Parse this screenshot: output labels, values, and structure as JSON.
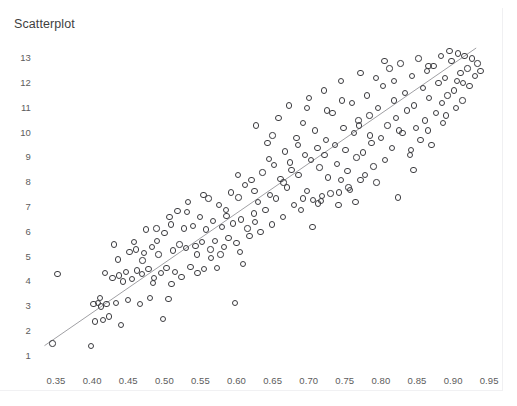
{
  "top_clipped_text": "·                    ·            ·                    ·",
  "chart_title": "Scatterplot",
  "axes": {
    "y_ticks": [
      "1",
      "2",
      "3",
      "4",
      "5",
      "6",
      "7",
      "8",
      "9",
      "10",
      "11",
      "12",
      "13"
    ],
    "x_ticks": [
      "0.35",
      "0.40",
      "0.45",
      "0.50",
      "0.55",
      "0.60",
      "0.65",
      "0.70",
      "0.75",
      "0.80",
      "0.85",
      "0.90",
      "0.95"
    ]
  },
  "colors": {
    "marker_stroke": "#3b3b3f",
    "trendline": "#a0a0a4",
    "tick_label": "#5c5c5c",
    "title": "#3f3f3f",
    "background": "#ffffff",
    "frame": "#f0f0f2"
  },
  "chart_data": {
    "type": "scatter",
    "title": "Scatterplot",
    "xlabel": "",
    "ylabel": "",
    "xlim": [
      0.325,
      0.965
    ],
    "ylim": [
      0.55,
      13.45
    ],
    "grid": false,
    "legend": "none",
    "x_tick_values": [
      0.35,
      0.4,
      0.45,
      0.5,
      0.55,
      0.6,
      0.65,
      0.7,
      0.75,
      0.8,
      0.85,
      0.9,
      0.95
    ],
    "y_tick_values": [
      1,
      2,
      3,
      4,
      5,
      6,
      7,
      8,
      9,
      10,
      11,
      12,
      13
    ],
    "marker": "open-circle",
    "series": [
      {
        "name": "observations",
        "points": [
          [
            0.345,
            1.45
          ],
          [
            0.352,
            4.25
          ],
          [
            0.398,
            1.35
          ],
          [
            0.402,
            3.05
          ],
          [
            0.404,
            2.35
          ],
          [
            0.408,
            3.1
          ],
          [
            0.411,
            3.3
          ],
          [
            0.415,
            2.4
          ],
          [
            0.418,
            4.3
          ],
          [
            0.42,
            3.05
          ],
          [
            0.423,
            2.55
          ],
          [
            0.428,
            4.1
          ],
          [
            0.43,
            5.45
          ],
          [
            0.433,
            3.1
          ],
          [
            0.437,
            4.2
          ],
          [
            0.44,
            2.2
          ],
          [
            0.443,
            3.95
          ],
          [
            0.447,
            4.35
          ],
          [
            0.45,
            3.2
          ],
          [
            0.452,
            5.15
          ],
          [
            0.455,
            4.05
          ],
          [
            0.458,
            5.55
          ],
          [
            0.462,
            4.4
          ],
          [
            0.466,
            3.05
          ],
          [
            0.469,
            4.25
          ],
          [
            0.472,
            5.1
          ],
          [
            0.475,
            6.05
          ],
          [
            0.478,
            4.45
          ],
          [
            0.48,
            3.3
          ],
          [
            0.483,
            5.35
          ],
          [
            0.486,
            4.1
          ],
          [
            0.489,
            6.1
          ],
          [
            0.492,
            5.05
          ],
          [
            0.495,
            4.3
          ],
          [
            0.498,
            2.45
          ],
          [
            0.5,
            5.9
          ],
          [
            0.503,
            4.5
          ],
          [
            0.506,
            3.25
          ],
          [
            0.509,
            6.25
          ],
          [
            0.512,
            5.2
          ],
          [
            0.515,
            4.35
          ],
          [
            0.518,
            6.8
          ],
          [
            0.521,
            5.45
          ],
          [
            0.524,
            4.15
          ],
          [
            0.527,
            6.1
          ],
          [
            0.53,
            5.3
          ],
          [
            0.533,
            7.15
          ],
          [
            0.536,
            4.55
          ],
          [
            0.54,
            6.2
          ],
          [
            0.543,
            5.4
          ],
          [
            0.546,
            4.3
          ],
          [
            0.549,
            6.55
          ],
          [
            0.552,
            5.55
          ],
          [
            0.555,
            4.45
          ],
          [
            0.558,
            6.05
          ],
          [
            0.561,
            7.3
          ],
          [
            0.564,
            5.25
          ],
          [
            0.567,
            6.4
          ],
          [
            0.57,
            5.6
          ],
          [
            0.573,
            4.5
          ],
          [
            0.576,
            7.05
          ],
          [
            0.58,
            6.15
          ],
          [
            0.583,
            5.35
          ],
          [
            0.586,
            6.6
          ],
          [
            0.589,
            5.7
          ],
          [
            0.592,
            7.55
          ],
          [
            0.595,
            6.3
          ],
          [
            0.598,
            3.1
          ],
          [
            0.6,
            5.5
          ],
          [
            0.603,
            7.35
          ],
          [
            0.606,
            6.45
          ],
          [
            0.609,
            4.65
          ],
          [
            0.612,
            7.85
          ],
          [
            0.615,
            6.1
          ],
          [
            0.618,
            5.8
          ],
          [
            0.621,
            8.05
          ],
          [
            0.624,
            6.7
          ],
          [
            0.627,
            10.25
          ],
          [
            0.63,
            7.15
          ],
          [
            0.633,
            5.95
          ],
          [
            0.636,
            8.35
          ],
          [
            0.64,
            6.85
          ],
          [
            0.643,
            9.55
          ],
          [
            0.646,
            7.45
          ],
          [
            0.649,
            6.25
          ],
          [
            0.652,
            8.65
          ],
          [
            0.655,
            7.3
          ],
          [
            0.658,
            10.55
          ],
          [
            0.661,
            8.1
          ],
          [
            0.664,
            6.55
          ],
          [
            0.667,
            9.2
          ],
          [
            0.67,
            7.75
          ],
          [
            0.673,
            11.05
          ],
          [
            0.676,
            8.45
          ],
          [
            0.68,
            7.05
          ],
          [
            0.683,
            9.75
          ],
          [
            0.686,
            8.25
          ],
          [
            0.689,
            6.85
          ],
          [
            0.692,
            10.35
          ],
          [
            0.695,
            9.05
          ],
          [
            0.698,
            7.6
          ],
          [
            0.7,
            11.35
          ],
          [
            0.703,
            8.85
          ],
          [
            0.706,
            7.25
          ],
          [
            0.709,
            10.05
          ],
          [
            0.712,
            9.35
          ],
          [
            0.715,
            8.55
          ],
          [
            0.718,
            7.4
          ],
          [
            0.721,
            11.65
          ],
          [
            0.724,
            9.65
          ],
          [
            0.727,
            8.15
          ],
          [
            0.73,
            7.5
          ],
          [
            0.733,
            10.75
          ],
          [
            0.736,
            9.45
          ],
          [
            0.739,
            8.7
          ],
          [
            0.742,
            7.55
          ],
          [
            0.745,
            12.05
          ],
          [
            0.748,
            10.15
          ],
          [
            0.751,
            9.25
          ],
          [
            0.754,
            8.4
          ],
          [
            0.757,
            7.65
          ],
          [
            0.76,
            11.15
          ],
          [
            0.763,
            9.95
          ],
          [
            0.766,
            8.95
          ],
          [
            0.769,
            10.45
          ],
          [
            0.772,
            12.35
          ],
          [
            0.775,
            9.15
          ],
          [
            0.778,
            8.25
          ],
          [
            0.781,
            11.45
          ],
          [
            0.784,
            10.65
          ],
          [
            0.787,
            9.55
          ],
          [
            0.79,
            8.6
          ],
          [
            0.793,
            12.15
          ],
          [
            0.796,
            10.95
          ],
          [
            0.8,
            9.75
          ],
          [
            0.803,
            11.85
          ],
          [
            0.806,
            8.85
          ],
          [
            0.809,
            10.25
          ],
          [
            0.812,
            12.55
          ],
          [
            0.815,
            9.35
          ],
          [
            0.818,
            11.25
          ],
          [
            0.821,
            10.55
          ],
          [
            0.824,
            7.35
          ],
          [
            0.827,
            12.75
          ],
          [
            0.83,
            9.95
          ],
          [
            0.833,
            11.55
          ],
          [
            0.836,
            10.85
          ],
          [
            0.84,
            9.05
          ],
          [
            0.843,
            12.25
          ],
          [
            0.846,
            11.05
          ],
          [
            0.849,
            10.15
          ],
          [
            0.852,
            12.95
          ],
          [
            0.855,
            9.65
          ],
          [
            0.858,
            11.75
          ],
          [
            0.861,
            10.45
          ],
          [
            0.864,
            12.45
          ],
          [
            0.867,
            11.35
          ],
          [
            0.87,
            9.45
          ],
          [
            0.873,
            12.65
          ],
          [
            0.876,
            10.75
          ],
          [
            0.88,
            11.95
          ],
          [
            0.883,
            13.05
          ],
          [
            0.886,
            10.35
          ],
          [
            0.889,
            12.15
          ],
          [
            0.892,
            11.45
          ],
          [
            0.895,
            13.25
          ],
          [
            0.898,
            12.85
          ],
          [
            0.901,
            11.65
          ],
          [
            0.904,
            10.95
          ],
          [
            0.907,
            13.15
          ],
          [
            0.91,
            12.35
          ],
          [
            0.913,
            11.25
          ],
          [
            0.916,
            13.05
          ],
          [
            0.92,
            12.55
          ],
          [
            0.923,
            11.85
          ],
          [
            0.926,
            12.95
          ],
          [
            0.93,
            12.25
          ],
          [
            0.934,
            12.75
          ],
          [
            0.938,
            12.45
          ],
          [
            0.47,
            4.8
          ],
          [
            0.49,
            5.6
          ],
          [
            0.51,
            3.85
          ],
          [
            0.545,
            5.05
          ],
          [
            0.565,
            4.9
          ],
          [
            0.585,
            6.85
          ],
          [
            0.605,
            5.15
          ],
          [
            0.625,
            7.6
          ],
          [
            0.645,
            8.9
          ],
          [
            0.665,
            7.95
          ],
          [
            0.685,
            9.45
          ],
          [
            0.705,
            6.15
          ],
          [
            0.725,
            10.85
          ],
          [
            0.745,
            8.05
          ],
          [
            0.765,
            7.15
          ],
          [
            0.785,
            9.85
          ],
          [
            0.805,
            12.85
          ],
          [
            0.825,
            10.05
          ],
          [
            0.845,
            8.45
          ],
          [
            0.865,
            10.05
          ],
          [
            0.885,
            11.15
          ],
          [
            0.905,
            12.05
          ],
          [
            0.412,
            2.95
          ],
          [
            0.436,
            4.85
          ],
          [
            0.461,
            5.25
          ],
          [
            0.484,
            3.9
          ],
          [
            0.507,
            6.55
          ],
          [
            0.531,
            6.75
          ],
          [
            0.554,
            7.45
          ],
          [
            0.578,
            5.05
          ],
          [
            0.602,
            8.25
          ],
          [
            0.626,
            6.35
          ],
          [
            0.65,
            9.85
          ],
          [
            0.674,
            8.75
          ],
          [
            0.698,
            10.95
          ],
          [
            0.722,
            9.05
          ],
          [
            0.746,
            11.25
          ],
          [
            0.77,
            10.25
          ],
          [
            0.794,
            7.95
          ],
          [
            0.818,
            12.05
          ],
          [
            0.842,
            9.25
          ],
          [
            0.866,
            12.65
          ],
          [
            0.89,
            10.65
          ],
          [
            0.914,
            11.95
          ],
          [
            0.741,
            7.05
          ],
          [
            0.713,
            7.1
          ],
          [
            0.717,
            7.2
          ],
          [
            0.692,
            7.3
          ],
          [
            0.755,
            7.75
          ],
          [
            0.772,
            8.05
          ]
        ]
      }
    ],
    "trendline": {
      "type": "linear",
      "x_start": 0.334,
      "y_start": 1.37,
      "x_end": 0.932,
      "y_end": 13.37
    }
  }
}
